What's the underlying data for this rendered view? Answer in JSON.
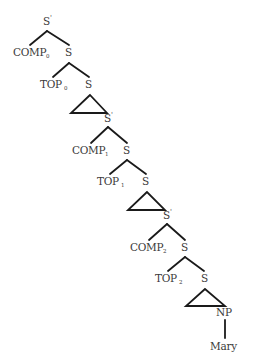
{
  "diagram": {
    "type": "syntax-tree",
    "colors": {
      "line": "#1a1a1a",
      "text": "#3a3a3a",
      "background": "#ffffff"
    },
    "nodes": {
      "root": {
        "label": "S",
        "prime": "'"
      },
      "comp0": {
        "label": "COMP",
        "sub": "0"
      },
      "s0": {
        "label": "S"
      },
      "top0": {
        "label": "TOP",
        "sub": "0"
      },
      "s0b": {
        "label": "S"
      },
      "sbar1": {
        "label": "S",
        "prime": "'"
      },
      "comp1": {
        "label": "COMP",
        "sub": "1"
      },
      "s1": {
        "label": "S"
      },
      "top1": {
        "label": "TOP",
        "sub": "1"
      },
      "s1b": {
        "label": "S"
      },
      "sbar2": {
        "label": "S",
        "prime": "'"
      },
      "comp2": {
        "label": "COMP",
        "sub": "2"
      },
      "s2": {
        "label": "S"
      },
      "top2": {
        "label": "TOP",
        "sub": "2"
      },
      "s2b": {
        "label": "S"
      },
      "np": {
        "label": "NP"
      },
      "leaf": {
        "label": "Mary"
      }
    }
  }
}
